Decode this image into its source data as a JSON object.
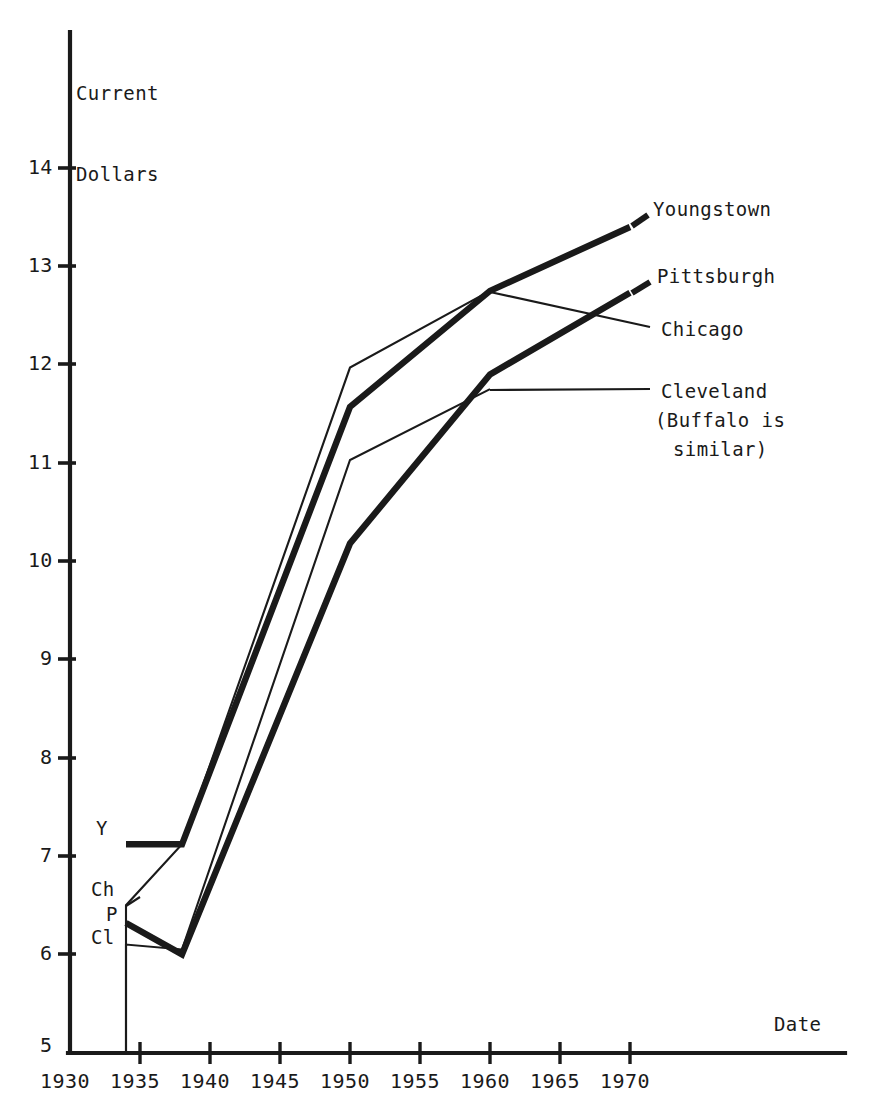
{
  "chart_data": {
    "type": "line",
    "title": "",
    "xlabel": "Date",
    "ylabel": "Current Dollars",
    "xlim": [
      1930,
      1974
    ],
    "ylim": [
      5,
      14.6
    ],
    "grid": false,
    "legend_position": "right-inline-labels",
    "x_ticks": [
      1930,
      1935,
      1940,
      1945,
      1950,
      1955,
      1960,
      1965,
      1970
    ],
    "y_ticks": [
      5,
      6,
      7,
      8,
      9,
      10,
      11,
      12,
      13,
      14
    ],
    "series": [
      {
        "name": "Youngstown",
        "short_name": "Y",
        "style": "thick",
        "x": [
          1934,
          1938,
          1950,
          1960,
          1970
        ],
        "values": [
          7.12,
          7.12,
          11.57,
          12.75,
          13.4
        ]
      },
      {
        "name": "Chicago",
        "short_name": "Ch",
        "style": "thin",
        "x": [
          1934,
          1938,
          1950,
          1960
        ],
        "values": [
          6.5,
          7.12,
          11.97,
          12.75
        ]
      },
      {
        "name": "Pittsburgh",
        "short_name": "P",
        "style": "thick",
        "x": [
          1934,
          1938,
          1950,
          1960,
          1970
        ],
        "values": [
          6.32,
          6.0,
          10.18,
          11.9,
          12.73
        ]
      },
      {
        "name": "Cleveland",
        "short_name": "Cl",
        "style": "thin",
        "note": "(Buffalo is similar)",
        "x": [
          1934,
          1938,
          1950,
          1960
        ],
        "values": [
          6.1,
          6.05,
          11.03,
          11.75
        ]
      }
    ],
    "annotations": [
      {
        "text": "Youngstown",
        "x": 1970,
        "y": 13.4
      },
      {
        "text": "Pittsburgh",
        "x": 1970,
        "y": 12.73
      },
      {
        "text": "Chicago",
        "x": 1960,
        "y": 12.75
      },
      {
        "text": "Cleveland",
        "x": 1960,
        "y": 11.75
      },
      {
        "text": "(Buffalo is",
        "x": 1960,
        "y": 11.4
      },
      {
        "text": "similar)",
        "x": 1960,
        "y": 11.1
      }
    ]
  },
  "axes": {
    "y_title_line1": "Current",
    "y_title_line2": "Dollars",
    "x_title": "Date",
    "y_tick_labels": [
      "14",
      "13",
      "12",
      "11",
      "10",
      "9",
      "8",
      "7",
      "6",
      "5"
    ],
    "x_tick_labels": [
      "1930",
      "1935",
      "1940",
      "1945",
      "1950",
      "1955",
      "1960",
      "1965",
      "1970"
    ]
  },
  "labels": {
    "left": [
      {
        "key": "youngstown",
        "text": "Y"
      },
      {
        "key": "chicago",
        "text": "Ch"
      },
      {
        "key": "pittsburgh",
        "text": "P"
      },
      {
        "key": "cleveland",
        "text": "Cl"
      }
    ],
    "right": [
      {
        "key": "youngstown",
        "text": "Youngstown"
      },
      {
        "key": "pittsburgh",
        "text": "Pittsburgh"
      },
      {
        "key": "chicago",
        "text": "Chicago"
      },
      {
        "key": "cleveland",
        "text": "Cleveland"
      },
      {
        "key": "cleveland-note-1",
        "text": "(Buffalo is"
      },
      {
        "key": "cleveland-note-2",
        "text": "similar)"
      }
    ]
  },
  "colors": {
    "ink": "#1a1a1a",
    "background": "#ffffff"
  }
}
